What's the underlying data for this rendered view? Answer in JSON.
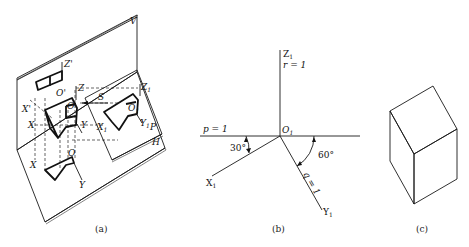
{
  "figure_a": {
    "caption": "(a)",
    "planes": {
      "v": "V",
      "p": "P",
      "h": "H"
    },
    "axes": {
      "z_prime": "Z'",
      "o_prime": "O'",
      "x_prime": "X'",
      "z": "Z",
      "o": "O",
      "x": "X",
      "y": "Y",
      "s": "S",
      "z1": "Z",
      "z1_sub": "1",
      "o1": "O",
      "o1_sub": "1",
      "x1": "X",
      "x1_sub": "1",
      "y1": "Y",
      "y1_sub": "1",
      "o_h": "O",
      "x_h": "X",
      "y_h": "Y"
    }
  },
  "figure_b": {
    "caption": "(b)",
    "z1": "Z",
    "z1_sub": "1",
    "r_label": "r = 1",
    "o1": "O",
    "o1_sub": "1",
    "p_label": "p = 1",
    "x1": "X",
    "x1_sub": "1",
    "y1": "Y",
    "y1_sub": "1",
    "angle_x": "30°",
    "angle_y": "60°",
    "q_label": "q = 1"
  },
  "figure_c": {
    "caption": "(c)"
  }
}
